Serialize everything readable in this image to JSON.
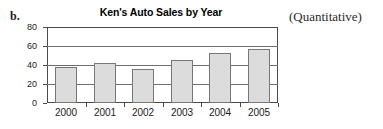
{
  "item_letter": "b.",
  "annotation": "(Quantitative)",
  "chart_data": {
    "type": "bar",
    "title": "Ken's Auto Sales by Year",
    "categories": [
      "2000",
      "2001",
      "2002",
      "2003",
      "2004",
      "2005"
    ],
    "values": [
      38,
      42,
      36,
      45,
      53,
      57
    ],
    "xlabel": "",
    "ylabel": "",
    "ylim": [
      0,
      80
    ],
    "yticks": [
      "0",
      "20",
      "40",
      "60",
      "80"
    ],
    "ytick_values": [
      0,
      20,
      40,
      60,
      80
    ],
    "grid": true,
    "legend": null,
    "bar_fill_color": "#dcdcdc",
    "bar_border_color": "#777777",
    "axis_color": "#4a4a4a"
  }
}
